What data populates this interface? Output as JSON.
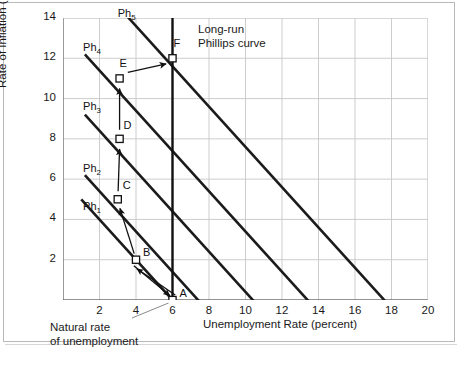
{
  "chart_data": {
    "type": "line",
    "title": "",
    "xlabel": "Unemployment Rate (percent)",
    "ylabel": "Rate of Inflation (percent per year)",
    "xlim": [
      0,
      20
    ],
    "ylim": [
      0,
      14
    ],
    "xticks": [
      2,
      4,
      6,
      8,
      10,
      12,
      14,
      16,
      18,
      20
    ],
    "yticks": [
      2,
      4,
      6,
      8,
      10,
      12,
      14
    ],
    "grid": true,
    "legend": "none",
    "series": [
      {
        "name": "Ph1",
        "label": "Ph",
        "subscript": "1",
        "label_x": 1.1,
        "label_y": 4.6,
        "x": [
          1.0,
          7.2
        ],
        "y": [
          5.0,
          -1.2
        ]
      },
      {
        "name": "Ph2",
        "label": "Ph",
        "subscript": "2",
        "label_x": 1.1,
        "label_y": 6.5,
        "x": [
          1.2,
          10.4
        ],
        "y": [
          6.2,
          -3.0
        ]
      },
      {
        "name": "Ph3",
        "label": "Ph",
        "subscript": "3",
        "label_x": 1.1,
        "label_y": 9.6,
        "x": [
          1.2,
          13.4
        ],
        "y": [
          9.2,
          -3.0
        ]
      },
      {
        "name": "Ph4",
        "label": "Ph",
        "subscript": "4",
        "label_x": 1.1,
        "label_y": 12.5,
        "x": [
          1.2,
          16.4
        ],
        "y": [
          12.2,
          -3.0
        ]
      },
      {
        "name": "Ph5",
        "label": "Ph",
        "subscript": "5",
        "label_x": 3.0,
        "label_y": 14.2,
        "x": [
          2.6,
          18.4
        ],
        "y": [
          15.0,
          -0.8
        ]
      }
    ],
    "long_run_curve": {
      "label": "Long-run\nPhillips curve",
      "label_line1": "Long-run",
      "label_line2": "Phillips curve",
      "x": 6.0,
      "y_from": 0,
      "y_to": 14
    },
    "points": [
      {
        "label": "A",
        "x": 6.0,
        "y": 0.0,
        "label_dx": 7,
        "label_dy": -13
      },
      {
        "label": "B",
        "x": 4.0,
        "y": 2.0,
        "label_dx": 7,
        "label_dy": -14
      },
      {
        "label": "C",
        "x": 3.0,
        "y": 5.0,
        "label_dx": 5,
        "label_dy": -20
      },
      {
        "label": "D",
        "x": 3.1,
        "y": 8.0,
        "label_dx": 4,
        "label_dy": -20
      },
      {
        "label": "E",
        "x": 3.1,
        "y": 11.0,
        "label_dx": 0,
        "label_dy": -21
      },
      {
        "label": "F",
        "x": 6.0,
        "y": 12.0,
        "label_dx": 1,
        "label_dy": -21
      }
    ],
    "annotations": [
      {
        "name": "natural-rate-note",
        "line1": "Natural rate",
        "line2": "of unemployment"
      }
    ]
  },
  "axis": {
    "xtick_labels": [
      "2",
      "4",
      "6",
      "8",
      "10",
      "12",
      "14",
      "16",
      "18",
      "20"
    ],
    "ytick_labels": [
      "2",
      "4",
      "6",
      "8",
      "10",
      "12",
      "14"
    ],
    "x_title": "Unemployment Rate (percent)",
    "y_title": "Rate of Inflation (percent per year)"
  },
  "colors": {
    "curve": "#1b1b1b",
    "grid": "#c7c7c7",
    "axis": "#6e6e6e",
    "marker_fill": "#ffffff",
    "text": "#141414"
  }
}
